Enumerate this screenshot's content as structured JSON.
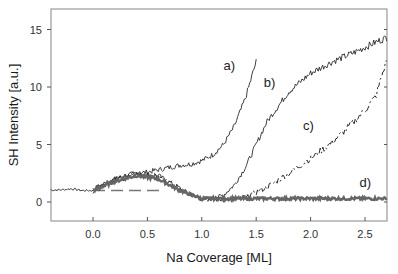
{
  "chart_data": {
    "type": "line",
    "title": "",
    "xlabel": "Na Coverage [ML]",
    "ylabel": "SH Intensity [a.u.]",
    "xlim": [
      -0.39,
      2.7
    ],
    "ylim": [
      -1.65,
      16.8
    ],
    "grid": false,
    "legend": "none (curves labeled inline)",
    "x_ticks": [
      0.0,
      0.5,
      1.0,
      1.5,
      2.0,
      2.5
    ],
    "x_tick_labels": [
      "0.0",
      "0.5",
      "1.0",
      "1.5",
      "2.0",
      "2.5"
    ],
    "y_ticks": [
      0,
      5,
      10,
      15
    ],
    "y_tick_labels": [
      "0",
      "5",
      "10",
      "15"
    ],
    "baseline_pre_deposition": {
      "x": [
        -0.39,
        -0.3,
        -0.2,
        -0.1,
        0.0
      ],
      "y": [
        1.05,
        1.05,
        1.15,
        1.0,
        1.0
      ]
    },
    "dashed_reference": {
      "x": [
        0.0,
        0.65
      ],
      "y": [
        1.0,
        1.0
      ],
      "style": "dashed"
    },
    "series": [
      {
        "name": "a)",
        "style": "solid-thin",
        "x": [
          0.0,
          0.1,
          0.2,
          0.3,
          0.4,
          0.5,
          0.6,
          0.7,
          0.8,
          0.9,
          1.0,
          1.1,
          1.2,
          1.3,
          1.4,
          1.5
        ],
        "y": [
          1.1,
          1.6,
          2.0,
          2.3,
          2.5,
          2.6,
          2.8,
          3.0,
          3.2,
          3.3,
          3.6,
          4.1,
          5.0,
          6.6,
          9.0,
          12.2
        ]
      },
      {
        "name": "b)",
        "style": "solid-thin",
        "x": [
          0.0,
          0.2,
          0.4,
          0.6,
          0.8,
          0.9,
          1.0,
          1.1,
          1.2,
          1.3,
          1.4,
          1.5,
          1.6,
          1.8,
          2.0,
          2.2,
          2.4,
          2.6,
          2.7
        ],
        "y": [
          1.1,
          2.0,
          2.5,
          2.3,
          1.2,
          0.6,
          0.3,
          0.25,
          0.6,
          1.5,
          3.0,
          5.0,
          7.0,
          9.6,
          11.2,
          12.2,
          13.0,
          13.9,
          14.3
        ]
      },
      {
        "name": "c)",
        "style": "dash-dot",
        "x": [
          0.0,
          0.2,
          0.4,
          0.6,
          0.8,
          1.0,
          1.2,
          1.4,
          1.6,
          1.8,
          2.0,
          2.2,
          2.4,
          2.5,
          2.6,
          2.7
        ],
        "y": [
          1.0,
          1.9,
          2.4,
          2.2,
          1.1,
          0.3,
          0.2,
          0.4,
          1.3,
          2.5,
          3.8,
          5.2,
          7.0,
          8.0,
          9.2,
          12.4
        ]
      },
      {
        "name": "d)",
        "style": "solid-thick-gray",
        "x": [
          0.0,
          0.2,
          0.4,
          0.6,
          0.8,
          1.0,
          1.2,
          1.5,
          2.0,
          2.5,
          2.7
        ],
        "y": [
          1.0,
          1.8,
          2.3,
          2.0,
          1.0,
          0.3,
          0.3,
          0.3,
          0.3,
          0.3,
          0.3
        ]
      }
    ],
    "annotations": [
      {
        "text": "a)",
        "x": 1.2,
        "y": 11.5
      },
      {
        "text": "b)",
        "x": 1.57,
        "y": 10.0
      },
      {
        "text": "c)",
        "x": 1.93,
        "y": 6.3
      },
      {
        "text": "d)",
        "x": 2.45,
        "y": 1.3
      }
    ]
  },
  "colors": {
    "frame": "#9a9a9a",
    "curve_dark": "#2a2a2a",
    "curve_gray": "#666666",
    "dashed": "#777777"
  }
}
